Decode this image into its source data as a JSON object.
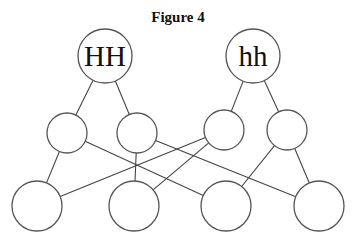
{
  "title": "Figure 4",
  "colors": {
    "stroke": "#555555",
    "text": "#111111",
    "background": "#ffffff"
  },
  "nodes": [
    {
      "id": "HH",
      "label": "HH",
      "cx": 105,
      "cy": 56,
      "r": 27
    },
    {
      "id": "hh",
      "label": "hh",
      "cx": 253,
      "cy": 56,
      "r": 27
    },
    {
      "id": "m1",
      "label": "",
      "cx": 67,
      "cy": 133,
      "r": 20
    },
    {
      "id": "m2",
      "label": "",
      "cx": 137,
      "cy": 133,
      "r": 20
    },
    {
      "id": "m3",
      "label": "",
      "cx": 224,
      "cy": 130,
      "r": 20
    },
    {
      "id": "m4",
      "label": "",
      "cx": 287,
      "cy": 130,
      "r": 20
    },
    {
      "id": "b1",
      "label": "",
      "cx": 37,
      "cy": 206,
      "r": 25
    },
    {
      "id": "b2",
      "label": "",
      "cx": 134,
      "cy": 206,
      "r": 25
    },
    {
      "id": "b3",
      "label": "",
      "cx": 226,
      "cy": 206,
      "r": 25
    },
    {
      "id": "b4",
      "label": "",
      "cx": 319,
      "cy": 206,
      "r": 25
    }
  ],
  "edges": [
    [
      "HH",
      "m1"
    ],
    [
      "HH",
      "m2"
    ],
    [
      "hh",
      "m3"
    ],
    [
      "hh",
      "m4"
    ],
    [
      "m1",
      "b1"
    ],
    [
      "m1",
      "b3"
    ],
    [
      "m2",
      "b2"
    ],
    [
      "m2",
      "b4"
    ],
    [
      "m3",
      "b1"
    ],
    [
      "m3",
      "b2"
    ],
    [
      "m4",
      "b3"
    ],
    [
      "m4",
      "b4"
    ]
  ]
}
